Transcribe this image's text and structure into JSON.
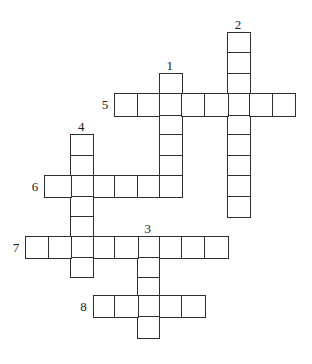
{
  "puzzle": {
    "type": "crossword",
    "colors": {
      "background": "#ffffff",
      "grid_line": "#2e2e2e",
      "number_text": "#222222"
    },
    "words": [
      {
        "number": "1",
        "direction": "down",
        "row": 2,
        "col": 6,
        "length": 6
      },
      {
        "number": "2",
        "direction": "down",
        "row": 0,
        "col": 9,
        "length": 9
      },
      {
        "number": "3",
        "direction": "down",
        "row": 10,
        "col": 5,
        "length": 5
      },
      {
        "number": "4",
        "direction": "down",
        "row": 5,
        "col": 2,
        "length": 7
      },
      {
        "number": "5",
        "direction": "across",
        "row": 3,
        "col": 4,
        "length": 8
      },
      {
        "number": "6",
        "direction": "across",
        "row": 7,
        "col": 1,
        "length": 6
      },
      {
        "number": "7",
        "direction": "across",
        "row": 10,
        "col": 0,
        "length": 9
      },
      {
        "number": "8",
        "direction": "across",
        "row": 13,
        "col": 3,
        "length": 5
      }
    ]
  }
}
